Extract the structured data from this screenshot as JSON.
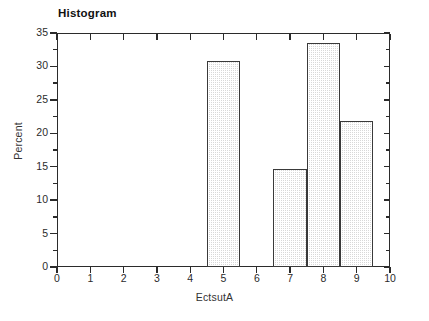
{
  "chart_data": {
    "type": "bar",
    "title": "Histogram",
    "xlabel": "EctsutA",
    "ylabel": "Percent",
    "categories": [
      "5",
      "7",
      "8",
      "9"
    ],
    "values": [
      30.8,
      14.6,
      33.5,
      21.8
    ],
    "bins": [
      {
        "label": "5",
        "left": 4.5,
        "right": 5.5,
        "percent": 30.8
      },
      {
        "label": "7",
        "left": 6.5,
        "right": 7.5,
        "percent": 14.6
      },
      {
        "label": "8",
        "left": 7.5,
        "right": 8.5,
        "percent": 33.5
      },
      {
        "label": "9",
        "left": 8.5,
        "right": 9.5,
        "percent": 21.8
      }
    ],
    "xlim": [
      0,
      10
    ],
    "ylim": [
      0,
      35
    ],
    "xticks": [
      "0",
      "1",
      "2",
      "3",
      "4",
      "5",
      "6",
      "7",
      "8",
      "9",
      "10"
    ],
    "yticks": [
      "0",
      "5",
      "10",
      "15",
      "20",
      "25",
      "30",
      "35"
    ],
    "y_minor_step": 2.5,
    "grid": false,
    "legend": false,
    "bar_fill_color": "#d8d8d8",
    "bar_edge_color": "#3a3a3a",
    "axis_color": "#2b2b2b",
    "background_color": "#ffffff"
  }
}
